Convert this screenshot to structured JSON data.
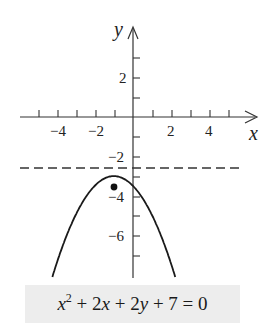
{
  "chart_data": {
    "type": "line",
    "title": "",
    "equation": "x^2 + 2x + 2y + 7 = 0",
    "xlabel": "x",
    "ylabel": "y",
    "xlim": [
      -7,
      6.5
    ],
    "ylim": [
      -8,
      4
    ],
    "x_ticks": [
      -6,
      -5,
      -4,
      -3,
      -2,
      -1,
      1,
      2,
      3,
      4,
      5
    ],
    "x_tick_labels": [
      "-4",
      "-2",
      "2",
      "4"
    ],
    "x_tick_label_values": [
      -4,
      -2,
      2,
      4
    ],
    "y_ticks": [
      3,
      2,
      1,
      -1,
      -2,
      -3,
      -4,
      -5,
      -6,
      -7
    ],
    "y_tick_labels": [
      "2",
      "-2",
      "-4",
      "-6"
    ],
    "y_tick_label_values": [
      2,
      -2,
      -4,
      -6
    ],
    "grid": false,
    "series": [
      {
        "name": "parabola",
        "style": "solid",
        "formula": "y = -(x+1)^2/2 - 3",
        "x": [
          -5.1,
          -4,
          -3,
          -2,
          -1,
          0,
          1,
          2,
          2.1
        ],
        "y": [
          -11.4,
          -7.5,
          -5,
          -3.5,
          -3,
          -3.5,
          -5,
          -7.5,
          -7.8
        ]
      },
      {
        "name": "directrix",
        "style": "dashed",
        "formula": "y = -2.5",
        "x": [
          -6,
          5.7
        ],
        "y": [
          -2.5,
          -2.5
        ]
      }
    ],
    "points": [
      {
        "name": "focus",
        "x": -1,
        "y": -3.5
      }
    ],
    "vertex": {
      "x": -1,
      "y": -3
    }
  },
  "caption": {
    "x": "x",
    "sup": "2",
    "rest_1": " + 2",
    "x2": "x",
    "rest_2": " + 2",
    "y": "y",
    "rest_3": " + 7 = 0"
  },
  "labels": {
    "x_axis": "x",
    "y_axis": "y",
    "xt_m4": "−4",
    "xt_m2": "−2",
    "xt_2": "2",
    "xt_4": "4",
    "yt_2": "2",
    "yt_m2": "−2",
    "yt_m4": "−4",
    "yt_m6": "−6"
  }
}
